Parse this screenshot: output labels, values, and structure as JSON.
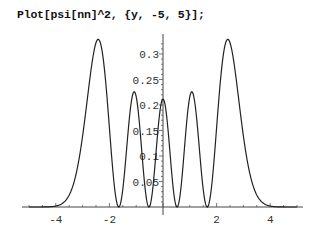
{
  "input": {
    "code": "Plot[psi[nn]^2, {y, -5, 5}];"
  },
  "chart_data": {
    "type": "line",
    "title": "",
    "xlabel": "",
    "ylabel": "",
    "function": "psi[nn]^2 (harmonic oscillator, n=4)",
    "xlim": [
      -5,
      5
    ],
    "ylim": [
      0,
      0.33
    ],
    "grid": false,
    "legend": null,
    "x_ticks": [
      -4,
      -2,
      2,
      4
    ],
    "x_tick_labels": [
      "-4",
      "-2",
      "2",
      "4"
    ],
    "y_ticks": [
      0.05,
      0.1,
      0.15,
      0.2,
      0.25,
      0.3
    ],
    "y_tick_labels": [
      "0.05",
      "0.1",
      "0.15",
      "0.2",
      "0.25",
      "0.3"
    ],
    "key_points": [
      {
        "x": -2.46,
        "y": 0.329,
        "note": "outer peak"
      },
      {
        "x": -1.86,
        "y": 0.0,
        "note": "node"
      },
      {
        "x": -1.22,
        "y": 0.226,
        "note": "inner peak"
      },
      {
        "x": -0.52,
        "y": 0.0,
        "note": "node"
      },
      {
        "x": 0.0,
        "y": 0.212,
        "note": "central peak"
      },
      {
        "x": 0.52,
        "y": 0.0,
        "note": "node"
      },
      {
        "x": 1.22,
        "y": 0.226,
        "note": "inner peak"
      },
      {
        "x": 1.86,
        "y": 0.0,
        "note": "node"
      },
      {
        "x": 2.46,
        "y": 0.329,
        "note": "outer peak"
      }
    ],
    "series": [
      {
        "name": "psi[nn]^2",
        "color": "#222222"
      }
    ]
  },
  "layout": {
    "origin_px": [
      163,
      207
    ],
    "x_scale_px_per_unit": 26.8,
    "y_scale_px_per_unit": 510,
    "x_axis_px_range": [
      22,
      303
    ],
    "y_axis_top_px": 34
  }
}
